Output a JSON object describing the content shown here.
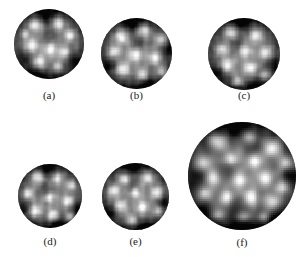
{
  "figure": {
    "background_color": "#ffffff",
    "label_color": "#1a1a1a",
    "panel_count": 6,
    "image_type": "grayscale-micrograph-disc",
    "panels": [
      {
        "id": "a",
        "label": "(a)",
        "disc": {
          "x": 14,
          "y": 9,
          "diameter": 70
        },
        "label_box": {
          "x": 14,
          "y": 89,
          "width": 70
        },
        "seed": 101,
        "base_gray": "#707070",
        "bright_blobs": [
          {
            "cx": 0.3,
            "cy": 0.22,
            "r": 0.12,
            "i": 0.82
          },
          {
            "cx": 0.63,
            "cy": 0.2,
            "r": 0.11,
            "i": 0.88
          },
          {
            "cx": 0.8,
            "cy": 0.38,
            "r": 0.1,
            "i": 0.78
          },
          {
            "cx": 0.24,
            "cy": 0.52,
            "r": 0.12,
            "i": 0.8
          },
          {
            "cx": 0.52,
            "cy": 0.58,
            "r": 0.11,
            "i": 0.85
          },
          {
            "cx": 0.72,
            "cy": 0.62,
            "r": 0.1,
            "i": 0.76
          },
          {
            "cx": 0.36,
            "cy": 0.76,
            "r": 0.11,
            "i": 0.8
          },
          {
            "cx": 0.62,
            "cy": 0.82,
            "r": 0.09,
            "i": 0.7
          },
          {
            "cx": 0.15,
            "cy": 0.36,
            "r": 0.08,
            "i": 0.66
          }
        ],
        "dark_blobs": [
          {
            "cx": 0.46,
            "cy": 0.12,
            "r": 0.16,
            "i": 0.72
          },
          {
            "cx": 0.16,
            "cy": 0.7,
            "r": 0.14,
            "i": 0.62
          },
          {
            "cx": 0.5,
            "cy": 0.38,
            "r": 0.13,
            "i": 0.55
          },
          {
            "cx": 0.85,
            "cy": 0.72,
            "r": 0.14,
            "i": 0.64
          },
          {
            "cx": 0.3,
            "cy": 0.95,
            "r": 0.15,
            "i": 0.68
          }
        ]
      },
      {
        "id": "b",
        "label": "(b)",
        "disc": {
          "x": 101,
          "y": 18,
          "diameter": 71
        },
        "label_box": {
          "x": 101,
          "y": 89,
          "width": 71
        },
        "seed": 202,
        "base_gray": "#6d6d6d",
        "bright_blobs": [
          {
            "cx": 0.28,
            "cy": 0.26,
            "r": 0.12,
            "i": 0.86
          },
          {
            "cx": 0.6,
            "cy": 0.18,
            "r": 0.11,
            "i": 0.84
          },
          {
            "cx": 0.84,
            "cy": 0.3,
            "r": 0.1,
            "i": 0.74
          },
          {
            "cx": 0.18,
            "cy": 0.48,
            "r": 0.11,
            "i": 0.78
          },
          {
            "cx": 0.48,
            "cy": 0.52,
            "r": 0.12,
            "i": 0.82
          },
          {
            "cx": 0.76,
            "cy": 0.56,
            "r": 0.11,
            "i": 0.8
          },
          {
            "cx": 0.3,
            "cy": 0.72,
            "r": 0.12,
            "i": 0.86
          },
          {
            "cx": 0.58,
            "cy": 0.8,
            "r": 0.1,
            "i": 0.74
          },
          {
            "cx": 0.86,
            "cy": 0.76,
            "r": 0.09,
            "i": 0.68
          }
        ],
        "dark_blobs": [
          {
            "cx": 0.44,
            "cy": 0.1,
            "r": 0.15,
            "i": 0.7
          },
          {
            "cx": 0.12,
            "cy": 0.66,
            "r": 0.14,
            "i": 0.66
          },
          {
            "cx": 0.52,
            "cy": 0.36,
            "r": 0.13,
            "i": 0.58
          },
          {
            "cx": 0.66,
            "cy": 0.96,
            "r": 0.15,
            "i": 0.66
          },
          {
            "cx": 0.94,
            "cy": 0.46,
            "r": 0.12,
            "i": 0.6
          }
        ]
      },
      {
        "id": "c",
        "label": "(c)",
        "disc": {
          "x": 208,
          "y": 18,
          "diameter": 72
        },
        "label_box": {
          "x": 208,
          "y": 89,
          "width": 72
        },
        "seed": 303,
        "base_gray": "#6a6a6a",
        "bright_blobs": [
          {
            "cx": 0.32,
            "cy": 0.2,
            "r": 0.11,
            "i": 0.8
          },
          {
            "cx": 0.66,
            "cy": 0.24,
            "r": 0.11,
            "i": 0.82
          },
          {
            "cx": 0.2,
            "cy": 0.44,
            "r": 0.1,
            "i": 0.74
          },
          {
            "cx": 0.52,
            "cy": 0.46,
            "r": 0.1,
            "i": 0.72
          },
          {
            "cx": 0.8,
            "cy": 0.48,
            "r": 0.11,
            "i": 0.8
          },
          {
            "cx": 0.26,
            "cy": 0.66,
            "r": 0.12,
            "i": 0.86
          },
          {
            "cx": 0.58,
            "cy": 0.7,
            "r": 0.11,
            "i": 0.84
          },
          {
            "cx": 0.8,
            "cy": 0.8,
            "r": 0.09,
            "i": 0.7
          },
          {
            "cx": 0.42,
            "cy": 0.88,
            "r": 0.09,
            "i": 0.66
          }
        ],
        "dark_blobs": [
          {
            "cx": 0.48,
            "cy": 0.08,
            "r": 0.16,
            "i": 0.74
          },
          {
            "cx": 0.14,
            "cy": 0.74,
            "r": 0.14,
            "i": 0.64
          },
          {
            "cx": 0.4,
            "cy": 0.34,
            "r": 0.12,
            "i": 0.56
          },
          {
            "cx": 0.9,
            "cy": 0.66,
            "r": 0.13,
            "i": 0.62
          },
          {
            "cx": 0.66,
            "cy": 0.96,
            "r": 0.14,
            "i": 0.66
          }
        ]
      },
      {
        "id": "d",
        "label": "(d)",
        "disc": {
          "x": 18,
          "y": 164,
          "diameter": 64
        },
        "label_box": {
          "x": 18,
          "y": 235,
          "width": 64
        },
        "seed": 404,
        "base_gray": "#707070",
        "bright_blobs": [
          {
            "cx": 0.3,
            "cy": 0.2,
            "r": 0.12,
            "i": 0.84
          },
          {
            "cx": 0.62,
            "cy": 0.22,
            "r": 0.11,
            "i": 0.8
          },
          {
            "cx": 0.84,
            "cy": 0.34,
            "r": 0.1,
            "i": 0.76
          },
          {
            "cx": 0.16,
            "cy": 0.46,
            "r": 0.11,
            "i": 0.78
          },
          {
            "cx": 0.5,
            "cy": 0.52,
            "r": 0.1,
            "i": 0.72
          },
          {
            "cx": 0.78,
            "cy": 0.58,
            "r": 0.11,
            "i": 0.82
          },
          {
            "cx": 0.26,
            "cy": 0.74,
            "r": 0.12,
            "i": 0.9
          },
          {
            "cx": 0.54,
            "cy": 0.8,
            "r": 0.11,
            "i": 0.86
          },
          {
            "cx": 0.82,
            "cy": 0.82,
            "r": 0.09,
            "i": 0.7
          }
        ],
        "dark_blobs": [
          {
            "cx": 0.46,
            "cy": 0.1,
            "r": 0.15,
            "i": 0.7
          },
          {
            "cx": 0.12,
            "cy": 0.68,
            "r": 0.13,
            "i": 0.6
          },
          {
            "cx": 0.42,
            "cy": 0.38,
            "r": 0.13,
            "i": 0.58
          },
          {
            "cx": 0.92,
            "cy": 0.7,
            "r": 0.13,
            "i": 0.62
          },
          {
            "cx": 0.62,
            "cy": 0.98,
            "r": 0.14,
            "i": 0.66
          }
        ]
      },
      {
        "id": "e",
        "label": "(e)",
        "disc": {
          "x": 102,
          "y": 163,
          "diameter": 67
        },
        "label_box": {
          "x": 102,
          "y": 235,
          "width": 67
        },
        "seed": 505,
        "base_gray": "#6b6b6b",
        "bright_blobs": [
          {
            "cx": 0.34,
            "cy": 0.24,
            "r": 0.11,
            "i": 0.82
          },
          {
            "cx": 0.68,
            "cy": 0.22,
            "r": 0.11,
            "i": 0.84
          },
          {
            "cx": 0.18,
            "cy": 0.42,
            "r": 0.11,
            "i": 0.8
          },
          {
            "cx": 0.5,
            "cy": 0.44,
            "r": 0.1,
            "i": 0.74
          },
          {
            "cx": 0.82,
            "cy": 0.44,
            "r": 0.11,
            "i": 0.82
          },
          {
            "cx": 0.28,
            "cy": 0.64,
            "r": 0.11,
            "i": 0.84
          },
          {
            "cx": 0.6,
            "cy": 0.66,
            "r": 0.11,
            "i": 0.86
          },
          {
            "cx": 0.84,
            "cy": 0.72,
            "r": 0.09,
            "i": 0.72
          },
          {
            "cx": 0.44,
            "cy": 0.86,
            "r": 0.1,
            "i": 0.76
          }
        ],
        "dark_blobs": [
          {
            "cx": 0.46,
            "cy": 0.08,
            "r": 0.16,
            "i": 0.76
          },
          {
            "cx": 0.12,
            "cy": 0.72,
            "r": 0.14,
            "i": 0.64
          },
          {
            "cx": 0.44,
            "cy": 0.32,
            "r": 0.12,
            "i": 0.54
          },
          {
            "cx": 0.92,
            "cy": 0.6,
            "r": 0.12,
            "i": 0.6
          },
          {
            "cx": 0.64,
            "cy": 0.96,
            "r": 0.14,
            "i": 0.68
          }
        ]
      },
      {
        "id": "f",
        "label": "(f)",
        "disc": {
          "x": 188,
          "y": 122,
          "diameter": 108
        },
        "label_box": {
          "x": 188,
          "y": 236,
          "width": 108
        },
        "seed": 606,
        "base_gray": "#6c6c6c",
        "bright_blobs": [
          {
            "cx": 0.28,
            "cy": 0.18,
            "r": 0.09,
            "i": 0.8
          },
          {
            "cx": 0.56,
            "cy": 0.14,
            "r": 0.08,
            "i": 0.76
          },
          {
            "cx": 0.78,
            "cy": 0.24,
            "r": 0.09,
            "i": 0.92
          },
          {
            "cx": 0.9,
            "cy": 0.38,
            "r": 0.08,
            "i": 0.8
          },
          {
            "cx": 0.14,
            "cy": 0.38,
            "r": 0.09,
            "i": 0.78
          },
          {
            "cx": 0.4,
            "cy": 0.34,
            "r": 0.07,
            "i": 0.68
          },
          {
            "cx": 0.62,
            "cy": 0.36,
            "r": 0.08,
            "i": 0.86
          },
          {
            "cx": 0.24,
            "cy": 0.52,
            "r": 0.08,
            "i": 0.74
          },
          {
            "cx": 0.48,
            "cy": 0.54,
            "r": 0.08,
            "i": 0.78
          },
          {
            "cx": 0.72,
            "cy": 0.52,
            "r": 0.08,
            "i": 0.82
          },
          {
            "cx": 0.88,
            "cy": 0.6,
            "r": 0.08,
            "i": 0.8
          },
          {
            "cx": 0.16,
            "cy": 0.66,
            "r": 0.08,
            "i": 0.78
          },
          {
            "cx": 0.36,
            "cy": 0.7,
            "r": 0.08,
            "i": 0.84
          },
          {
            "cx": 0.58,
            "cy": 0.7,
            "r": 0.08,
            "i": 0.86
          },
          {
            "cx": 0.78,
            "cy": 0.74,
            "r": 0.08,
            "i": 0.8
          },
          {
            "cx": 0.28,
            "cy": 0.86,
            "r": 0.07,
            "i": 0.7
          },
          {
            "cx": 0.52,
            "cy": 0.88,
            "r": 0.07,
            "i": 0.72
          },
          {
            "cx": 0.7,
            "cy": 0.88,
            "r": 0.06,
            "i": 0.64
          }
        ],
        "dark_blobs": [
          {
            "cx": 0.44,
            "cy": 0.06,
            "r": 0.14,
            "i": 0.72
          },
          {
            "cx": 0.08,
            "cy": 0.52,
            "r": 0.12,
            "i": 0.6
          },
          {
            "cx": 0.34,
            "cy": 0.46,
            "r": 0.11,
            "i": 0.56
          },
          {
            "cx": 0.6,
            "cy": 0.24,
            "r": 0.1,
            "i": 0.54
          },
          {
            "cx": 0.94,
            "cy": 0.5,
            "r": 0.11,
            "i": 0.58
          },
          {
            "cx": 0.46,
            "cy": 0.78,
            "r": 0.11,
            "i": 0.56
          },
          {
            "cx": 0.5,
            "cy": 0.98,
            "r": 0.14,
            "i": 0.7
          },
          {
            "cx": 0.84,
            "cy": 0.92,
            "r": 0.12,
            "i": 0.64
          },
          {
            "cx": 0.14,
            "cy": 0.84,
            "r": 0.11,
            "i": 0.6
          }
        ]
      }
    ]
  }
}
